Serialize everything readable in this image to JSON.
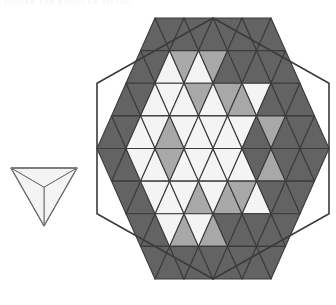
{
  "page": {
    "width": 336,
    "height": 305,
    "background": "#ffffff",
    "header_text": "FIGURE  THE  REGULAR  TILING"
  },
  "palette": {
    "dark": "#636363",
    "medium": "#a8a8a8",
    "light": "#f4f4f4",
    "stroke": "#3b3b3b",
    "stroke_light": "#6e6e6e",
    "background": "#ffffff"
  },
  "figures": [
    {
      "id": "small-triangle",
      "name": "small-triangle-motif",
      "label": "single downward triangle subdivided into three faces",
      "orientation": "down",
      "center": {
        "x": 44.0,
        "y": 192.0
      },
      "vertices": [
        {
          "x": 11.0,
          "y": 168.0
        },
        {
          "x": 77.0,
          "y": 168.0
        },
        {
          "x": 44.0,
          "y": 226.0
        }
      ],
      "centroid": {
        "x": 44.0,
        "y": 187.3
      },
      "faces": [
        {
          "name": "face-top",
          "fill": "light"
        },
        {
          "name": "face-right",
          "fill": "light"
        },
        {
          "name": "face-left",
          "fill": "light"
        }
      ]
    },
    {
      "id": "hexagon",
      "name": "hexagon-tiling",
      "label": "regular hexagon filled with a shaded triangular grid",
      "center": {
        "x": 213.0,
        "y": 148.5
      },
      "circumradius_x": 116.0,
      "circumradius_y": 130.5,
      "side_units": 4,
      "triangle_count": 96,
      "orientation": "pointy-top",
      "vertices": [
        {
          "x": 213.0,
          "y": 18.0
        },
        {
          "x": 329.0,
          "y": 83.25
        },
        {
          "x": 329.0,
          "y": 213.75
        },
        {
          "x": 213.0,
          "y": 279.0
        },
        {
          "x": 97.0,
          "y": 213.75
        },
        {
          "x": 97.0,
          "y": 83.25
        }
      ]
    }
  ],
  "chart_data": {
    "type": "diagram",
    "grid_unit_x": 29.0,
    "grid_unit_y": 32.625,
    "rows": 8,
    "shade_legend": [
      {
        "key": "dark",
        "hex": "#636363",
        "label": "dark face"
      },
      {
        "key": "medium",
        "hex": "#a8a8a8",
        "label": "medium face"
      },
      {
        "key": "light",
        "hex": "#f4f4f4",
        "label": "light face"
      }
    ],
    "note": "Each hexagon row r (0 at top) holds up-and-down triangles on a 4-unit-side hexagon lattice.",
    "rows_data": [
      {
        "row": 0,
        "down": [
          "dark",
          "dark"
        ],
        "up": [
          "dark",
          "dark",
          "dark"
        ]
      },
      {
        "row": 1,
        "down": [
          "dark",
          "medium",
          "medium",
          "dark"
        ],
        "up": [
          "dark",
          "light",
          "light",
          "dark",
          "dark"
        ]
      },
      {
        "row": 2,
        "down": [
          "dark",
          "light",
          "medium",
          "medium",
          "light",
          "dark"
        ],
        "up": [
          "dark",
          "light",
          "light",
          "light",
          "medium",
          "dark",
          "dark"
        ]
      },
      {
        "row": 3,
        "down": [
          "dark",
          "light",
          "light",
          "light",
          "light",
          "medium",
          "dark",
          "dark"
        ],
        "up": [
          "dark",
          "light",
          "medium",
          "light",
          "light",
          "dark",
          "dark",
          "dark",
          "dark"
        ]
      },
      {
        "row": 4,
        "down": [
          "dark",
          "light",
          "medium",
          "light",
          "light",
          "dark",
          "dark",
          "dark",
          "dark"
        ],
        "up": [
          "dark",
          "light",
          "light",
          "light",
          "light",
          "medium",
          "dark",
          "dark"
        ]
      },
      {
        "row": 5,
        "down": [
          "dark",
          "light",
          "light",
          "light",
          "medium",
          "dark",
          "dark"
        ],
        "up": [
          "dark",
          "light",
          "medium",
          "medium",
          "light",
          "dark"
        ]
      },
      {
        "row": 6,
        "down": [
          "dark",
          "light",
          "light",
          "dark",
          "dark"
        ],
        "up": [
          "dark",
          "medium",
          "medium",
          "dark"
        ]
      },
      {
        "row": 7,
        "down": [
          "dark",
          "dark",
          "dark"
        ],
        "up": [
          "dark",
          "dark"
        ]
      }
    ]
  }
}
